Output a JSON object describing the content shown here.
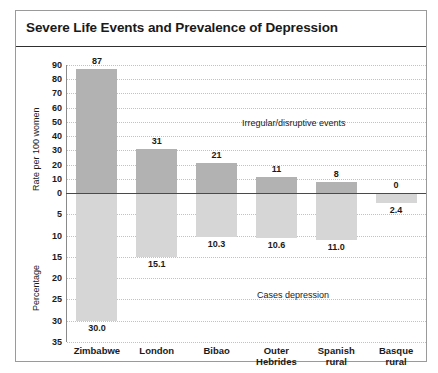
{
  "figure": {
    "title": "Severe Life Events and Prevalence of Depression"
  },
  "chart_data": {
    "type": "bar",
    "title": "Severe Life Events and Prevalence of Depression",
    "orientation": "vertical-diverging",
    "categories": [
      "Zimbabwe",
      "London",
      "Bibao",
      "Outer Hebrides",
      "Spanish rural",
      "Basque rural"
    ],
    "category_lines": [
      [
        "Zimbabwe"
      ],
      [
        "London"
      ],
      [
        "Bibao"
      ],
      [
        "Outer",
        "Hebrides"
      ],
      [
        "Spanish",
        "rural"
      ],
      [
        "Basque",
        "rural"
      ]
    ],
    "series": [
      {
        "name": "Irregular/disruptive events",
        "axis": "upper",
        "ylabel": "Rate per 100 women",
        "values": [
          87,
          31,
          21,
          11,
          8,
          0
        ],
        "labels": [
          "87",
          "31",
          "21",
          "11",
          "8",
          "0"
        ],
        "color": "#b2b2b2",
        "ylim": [
          0,
          90
        ],
        "ticks": [
          90,
          80,
          70,
          60,
          50,
          40,
          30,
          20,
          10,
          0
        ]
      },
      {
        "name": "Cases depression",
        "axis": "lower",
        "ylabel": "Percentage",
        "values": [
          30.0,
          15.1,
          10.3,
          10.6,
          11.0,
          2.4
        ],
        "labels": [
          "30.0",
          "15.1",
          "10.3",
          "10.6",
          "11.0",
          "2.4"
        ],
        "color": "#d6d6d6",
        "ylim": [
          0,
          35
        ],
        "ticks": [
          0,
          5,
          10,
          15,
          20,
          25,
          30,
          35
        ]
      }
    ],
    "annotations": [
      {
        "text": "Irregular/disruptive events",
        "region": "upper"
      },
      {
        "text": "Cases depression",
        "region": "lower"
      }
    ],
    "grid": "dotted-horizontal",
    "legend": "inline-annotation",
    "xlabel": ""
  }
}
